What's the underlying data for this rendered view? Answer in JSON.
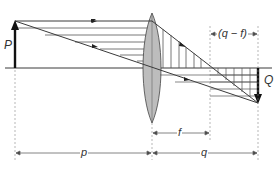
{
  "diagram": {
    "colors": {
      "line": "#3a3a3a",
      "hatch": "#555555",
      "lens_fill": "#bdbdbd",
      "dim": "#777777",
      "arrow": "#111111"
    },
    "labels": {
      "object": "P",
      "image": "Q",
      "object_distance": "p",
      "image_distance": "q",
      "focal_length": "f",
      "image_minus_focal": "(q − f)"
    },
    "geometry": {
      "axis_y": 68,
      "object_x": 15,
      "object_top_y": 21,
      "lens_x": 152,
      "lens_top_y": 13,
      "lens_bottom_y": 123,
      "focal_x": 210,
      "image_x": 258,
      "image_bottom_y": 103
    }
  }
}
